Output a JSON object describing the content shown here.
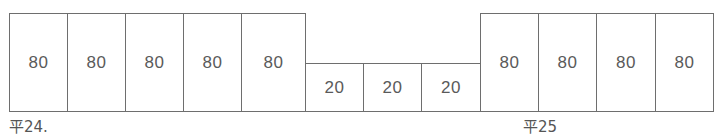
{
  "figure": {
    "title": "",
    "stroke_color": "#6e6e6e",
    "text_color": "#5a5a5a",
    "background_color": "#ffffff"
  },
  "groups": [
    {
      "name": "left-tall-group",
      "height_class": "tall",
      "cells": [
        {
          "value": "80",
          "x": 9,
          "y": 13,
          "w": 59,
          "h": 99
        },
        {
          "value": "80",
          "x": 67,
          "y": 13,
          "w": 59,
          "h": 99
        },
        {
          "value": "80",
          "x": 125,
          "y": 13,
          "w": 59,
          "h": 99
        },
        {
          "value": "80",
          "x": 183,
          "y": 13,
          "w": 59,
          "h": 99
        },
        {
          "value": "80",
          "x": 241,
          "y": 13,
          "w": 65,
          "h": 99
        }
      ]
    },
    {
      "name": "middle-short-group",
      "height_class": "short",
      "cells": [
        {
          "value": "20",
          "x": 305,
          "y": 63,
          "w": 59,
          "h": 49
        },
        {
          "value": "20",
          "x": 363,
          "y": 63,
          "w": 59,
          "h": 49
        },
        {
          "value": "20",
          "x": 421,
          "y": 63,
          "w": 60,
          "h": 49
        }
      ]
    },
    {
      "name": "right-tall-group",
      "height_class": "tall",
      "cells": [
        {
          "value": "80",
          "x": 480,
          "y": 13,
          "w": 59,
          "h": 99
        },
        {
          "value": "80",
          "x": 538,
          "y": 13,
          "w": 59,
          "h": 99
        },
        {
          "value": "80",
          "x": 596,
          "y": 13,
          "w": 60,
          "h": 99
        },
        {
          "value": "80",
          "x": 655,
          "y": 13,
          "w": 59,
          "h": 99
        }
      ]
    }
  ],
  "labels": [
    {
      "name": "era-label-left",
      "text": "平24.",
      "x": 9,
      "y": 120
    },
    {
      "name": "era-label-right",
      "text": "平25",
      "x": 523,
      "y": 120
    }
  ],
  "chart_data": {
    "type": "bar",
    "title": "",
    "xlabel": "",
    "ylabel": "",
    "categories": [
      "1",
      "2",
      "3",
      "4",
      "5",
      "6",
      "7",
      "8",
      "9",
      "10",
      "11",
      "12"
    ],
    "values": [
      80,
      80,
      80,
      80,
      80,
      20,
      20,
      20,
      80,
      80,
      80,
      80
    ],
    "value_labels": [
      "80",
      "80",
      "80",
      "80",
      "80",
      "20",
      "20",
      "20",
      "80",
      "80",
      "80",
      "80"
    ],
    "ylim": [
      0,
      80
    ],
    "grid": false,
    "legend": false,
    "annotations": [
      "平24.",
      "平25"
    ]
  }
}
